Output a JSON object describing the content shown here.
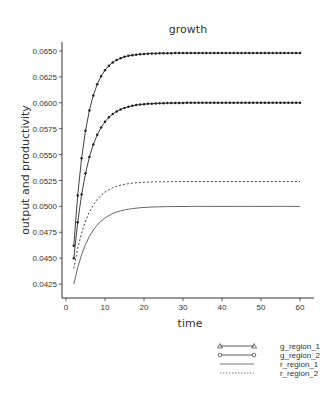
{
  "chart_data": {
    "type": "line",
    "title": "growth",
    "xlabel": "time",
    "ylabel": "output and productivity",
    "xlim": [
      0,
      62
    ],
    "ylim": [
      0.0415,
      0.0658
    ],
    "grid": false,
    "legend_position": "bottom-right, below plot",
    "x_ticks": [
      0,
      10,
      20,
      30,
      40,
      50,
      60
    ],
    "y_ticks": [
      "0.0425",
      "0.0450",
      "0.0475",
      "0.0500",
      "0.0525",
      "0.0550",
      "0.0575",
      "0.0600",
      "0.0625",
      "0.0650"
    ],
    "x": [
      2,
      3,
      4,
      5,
      6,
      7,
      8,
      9,
      10,
      11,
      12,
      13,
      14,
      15,
      16,
      17,
      18,
      19,
      20,
      21,
      22,
      23,
      24,
      25,
      26,
      27,
      28,
      29,
      30,
      31,
      32,
      33,
      34,
      35,
      36,
      37,
      38,
      39,
      40,
      41,
      42,
      43,
      44,
      45,
      46,
      47,
      48,
      49,
      50,
      51,
      52,
      53,
      54,
      55,
      56,
      57,
      58,
      59,
      60
    ],
    "series": [
      {
        "name": "g_region_1",
        "style": "solid-marker-triangle",
        "values": [
          0.0462,
          0.05106,
          0.05465,
          0.05731,
          0.05926,
          0.06071,
          0.06178,
          0.06257,
          0.06315,
          0.06358,
          0.0639,
          0.06414,
          0.06431,
          0.06444,
          0.06453,
          0.0646,
          0.06465,
          0.06469,
          0.06472,
          0.06474,
          0.06476,
          0.06477,
          0.06478,
          0.06479,
          0.06479,
          0.06479,
          0.0648,
          0.0648,
          0.0648,
          0.0648,
          0.0648,
          0.0648,
          0.0648,
          0.0648,
          0.0648,
          0.0648,
          0.0648,
          0.0648,
          0.0648,
          0.0648,
          0.0648,
          0.0648,
          0.0648,
          0.0648,
          0.0648,
          0.0648,
          0.0648,
          0.0648,
          0.0648,
          0.0648,
          0.0648,
          0.0648,
          0.0648,
          0.0648,
          0.0648,
          0.0648,
          0.0648,
          0.0648,
          0.0648
        ]
      },
      {
        "name": "g_region_2",
        "style": "solid-marker-circle",
        "values": [
          0.045,
          0.04847,
          0.05114,
          0.05319,
          0.05477,
          0.05598,
          0.05691,
          0.05762,
          0.05817,
          0.0586,
          0.05892,
          0.05917,
          0.05936,
          0.05951,
          0.05962,
          0.05971,
          0.05978,
          0.05983,
          0.05987,
          0.0599,
          0.05992,
          0.05994,
          0.05995,
          0.05996,
          0.05997,
          0.05998,
          0.05998,
          0.05999,
          0.05999,
          0.06,
          0.06,
          0.06,
          0.06,
          0.06,
          0.06,
          0.06,
          0.06,
          0.06,
          0.06,
          0.06,
          0.06,
          0.06,
          0.06,
          0.06,
          0.06,
          0.06,
          0.06,
          0.06,
          0.06,
          0.06,
          0.06,
          0.06,
          0.06,
          0.06,
          0.06,
          0.06,
          0.06,
          0.06,
          0.06
        ]
      },
      {
        "name": "r_region_1",
        "style": "solid",
        "values": [
          0.0425,
          0.04409,
          0.04534,
          0.04633,
          0.04711,
          0.04772,
          0.0482,
          0.04858,
          0.04888,
          0.04912,
          0.04931,
          0.04945,
          0.04957,
          0.04966,
          0.04973,
          0.04979,
          0.04983,
          0.04987,
          0.0499,
          0.04992,
          0.04994,
          0.04995,
          0.04996,
          0.04997,
          0.04998,
          0.04998,
          0.04999,
          0.04999,
          0.04999,
          0.04999,
          0.05,
          0.05,
          0.05,
          0.05,
          0.05,
          0.05,
          0.05,
          0.05,
          0.05,
          0.05,
          0.05,
          0.05,
          0.05,
          0.05,
          0.05,
          0.05,
          0.05,
          0.05,
          0.05,
          0.05,
          0.05,
          0.05,
          0.05,
          0.05,
          0.05,
          0.05,
          0.05,
          0.05,
          0.05
        ]
      },
      {
        "name": "r_region_2",
        "style": "dashed",
        "values": [
          0.044,
          0.04594,
          0.04744,
          0.04859,
          0.04947,
          0.05015,
          0.05067,
          0.05107,
          0.05138,
          0.05161,
          0.0518,
          0.05194,
          0.05204,
          0.05213,
          0.05219,
          0.05224,
          0.05228,
          0.0523,
          0.05233,
          0.05234,
          0.05236,
          0.05237,
          0.05237,
          0.05238,
          0.05238,
          0.05239,
          0.0524,
          0.0524,
          0.0524,
          0.0524,
          0.0524,
          0.0524,
          0.0524,
          0.0524,
          0.0524,
          0.0524,
          0.0524,
          0.0524,
          0.0524,
          0.0524,
          0.0524,
          0.0524,
          0.0524,
          0.0524,
          0.0524,
          0.0524,
          0.0524,
          0.0524,
          0.0524,
          0.0524,
          0.0524,
          0.0524,
          0.0524,
          0.0524,
          0.0524,
          0.0524,
          0.0524,
          0.0524,
          0.0524
        ]
      }
    ]
  },
  "legend": {
    "items": [
      {
        "label": "g_region_1",
        "marker": "triangle"
      },
      {
        "label": "g_region_2",
        "marker": "circle"
      },
      {
        "label": "r_region_1",
        "marker": "none-solid"
      },
      {
        "label": "r_region_2",
        "marker": "none-dashed"
      }
    ]
  },
  "colors": {
    "line": "#2a2a2a",
    "axis": "#333333",
    "background": "#ffffff"
  }
}
